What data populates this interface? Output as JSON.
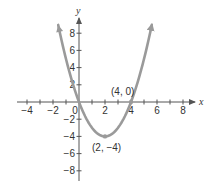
{
  "chart_data": {
    "type": "line",
    "title": "",
    "function": "y = x^2 - 4x",
    "xlabel": "x",
    "ylabel": "y",
    "xlim": [
      -4.8,
      8.8
    ],
    "ylim": [
      -9,
      9.5
    ],
    "x_ticks": [
      -4,
      -2,
      0,
      2,
      4,
      6,
      8
    ],
    "x_tick_labels": [
      "−4",
      "−2",
      "0",
      "2",
      "4",
      "6",
      "8"
    ],
    "x_minor_ticks": [
      -4,
      -3,
      -2,
      -1,
      1,
      2,
      3,
      4,
      5,
      6,
      7,
      8
    ],
    "y_ticks": [
      8,
      6,
      4,
      2,
      -2,
      -4,
      -6,
      -8
    ],
    "y_tick_labels": [
      "8",
      "6",
      "4",
      "2",
      "−2",
      "−4",
      "−6",
      "−8"
    ],
    "grid": false,
    "legend": null,
    "series": [
      {
        "name": "parabola",
        "x_range": [
          -1.6,
          5.6
        ],
        "points": [
          [
            -1.6,
            8.96
          ],
          [
            -1,
            5
          ],
          [
            0,
            0
          ],
          [
            1,
            -3
          ],
          [
            2,
            -4
          ],
          [
            3,
            -3
          ],
          [
            4,
            0
          ],
          [
            5,
            5
          ],
          [
            5.6,
            8.96
          ]
        ],
        "color": "#9a9a9a",
        "arrows_at_ends": true
      }
    ],
    "annotations": [
      {
        "point": [
          4,
          0
        ],
        "label": "(4, 0)"
      },
      {
        "point": [
          2,
          -4
        ],
        "label": "(2, −4)"
      }
    ]
  },
  "labels": {
    "x_axis": "x",
    "y_axis": "y",
    "origin": "0",
    "vertex": "(2, −4)",
    "root": "(4, 0)"
  },
  "colors": {
    "curve": "#9a9a9a",
    "axis": "#555555",
    "text": "#333333"
  }
}
